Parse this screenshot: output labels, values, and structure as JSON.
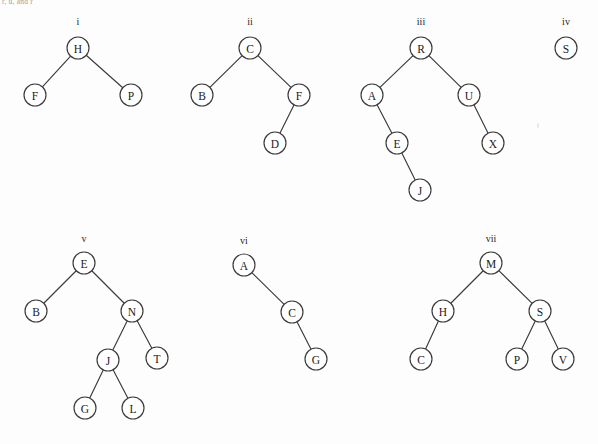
{
  "page": {
    "caption_fragment": "r, u, and r",
    "background_color": "#fdfdfd",
    "node_stroke_color": "#3a3a3a",
    "node_fill_color": "#ffffff",
    "text_color": "#1b1b1b",
    "width": 598,
    "height": 444
  },
  "chart_data": {
    "type": "diagram",
    "diagram_kind": "binary-tree-collection",
    "title": "",
    "trees": [
      {
        "label": "i",
        "label_x": 78,
        "label_y": 21,
        "nodes": [
          {
            "id": "n1",
            "value": "H",
            "x": 78,
            "y": 48,
            "r": 11
          },
          {
            "id": "n2",
            "value": "F",
            "x": 35,
            "y": 95,
            "r": 11
          },
          {
            "id": "n3",
            "value": "P",
            "x": 131,
            "y": 95,
            "r": 11
          }
        ],
        "edges": [
          {
            "from": "n1",
            "to": "n2"
          },
          {
            "from": "n1",
            "to": "n3"
          }
        ]
      },
      {
        "label": "ii",
        "label_x": 250,
        "label_y": 21,
        "nodes": [
          {
            "id": "n1",
            "value": "C",
            "x": 250,
            "y": 48,
            "r": 11
          },
          {
            "id": "n2",
            "value": "B",
            "x": 202,
            "y": 95,
            "r": 11
          },
          {
            "id": "n3",
            "value": "F",
            "x": 299,
            "y": 95,
            "r": 11
          },
          {
            "id": "n4",
            "value": "D",
            "x": 275,
            "y": 143,
            "r": 11
          }
        ],
        "edges": [
          {
            "from": "n1",
            "to": "n2"
          },
          {
            "from": "n1",
            "to": "n3"
          },
          {
            "from": "n3",
            "to": "n4"
          }
        ]
      },
      {
        "label": "iii",
        "label_x": 421,
        "label_y": 21,
        "nodes": [
          {
            "id": "n1",
            "value": "R",
            "x": 421,
            "y": 48,
            "r": 11
          },
          {
            "id": "n2",
            "value": "A",
            "x": 372,
            "y": 95,
            "r": 11
          },
          {
            "id": "n3",
            "value": "U",
            "x": 469,
            "y": 95,
            "r": 11
          },
          {
            "id": "n4",
            "value": "E",
            "x": 397,
            "y": 143,
            "r": 11
          },
          {
            "id": "n5",
            "value": "X",
            "x": 493,
            "y": 143,
            "r": 11
          },
          {
            "id": "n6",
            "value": "J",
            "x": 420,
            "y": 190,
            "r": 11
          }
        ],
        "edges": [
          {
            "from": "n1",
            "to": "n2"
          },
          {
            "from": "n1",
            "to": "n3"
          },
          {
            "from": "n2",
            "to": "n4"
          },
          {
            "from": "n3",
            "to": "n5"
          },
          {
            "from": "n4",
            "to": "n6"
          }
        ]
      },
      {
        "label": "iv",
        "label_x": 566,
        "label_y": 21,
        "nodes": [
          {
            "id": "n1",
            "value": "S",
            "x": 566,
            "y": 48,
            "r": 11
          }
        ],
        "edges": []
      },
      {
        "label": "v",
        "label_x": 84,
        "label_y": 238,
        "nodes": [
          {
            "id": "n1",
            "value": "E",
            "x": 84,
            "y": 263,
            "r": 11
          },
          {
            "id": "n2",
            "value": "B",
            "x": 36,
            "y": 311,
            "r": 11
          },
          {
            "id": "n3",
            "value": "N",
            "x": 132,
            "y": 311,
            "r": 11
          },
          {
            "id": "n4",
            "value": "J",
            "x": 108,
            "y": 360,
            "r": 11
          },
          {
            "id": "n5",
            "value": "T",
            "x": 157,
            "y": 358,
            "r": 11
          },
          {
            "id": "n6",
            "value": "G",
            "x": 85,
            "y": 408,
            "r": 11
          },
          {
            "id": "n7",
            "value": "L",
            "x": 133,
            "y": 408,
            "r": 11
          }
        ],
        "edges": [
          {
            "from": "n1",
            "to": "n2"
          },
          {
            "from": "n1",
            "to": "n3"
          },
          {
            "from": "n3",
            "to": "n4"
          },
          {
            "from": "n3",
            "to": "n5"
          },
          {
            "from": "n4",
            "to": "n6"
          },
          {
            "from": "n4",
            "to": "n7"
          }
        ]
      },
      {
        "label": "vi",
        "label_x": 244,
        "label_y": 240,
        "nodes": [
          {
            "id": "n1",
            "value": "A",
            "x": 244,
            "y": 265,
            "r": 11
          },
          {
            "id": "n2",
            "value": "C",
            "x": 292,
            "y": 312,
            "r": 11
          },
          {
            "id": "n3",
            "value": "G",
            "x": 316,
            "y": 359,
            "r": 11
          }
        ],
        "edges": [
          {
            "from": "n1",
            "to": "n2"
          },
          {
            "from": "n2",
            "to": "n3"
          }
        ]
      },
      {
        "label": "vii",
        "label_x": 491,
        "label_y": 238,
        "nodes": [
          {
            "id": "n1",
            "value": "M",
            "x": 491,
            "y": 263,
            "r": 11
          },
          {
            "id": "n2",
            "value": "H",
            "x": 443,
            "y": 311,
            "r": 11
          },
          {
            "id": "n3",
            "value": "S",
            "x": 540,
            "y": 311,
            "r": 11
          },
          {
            "id": "n4",
            "value": "C",
            "x": 421,
            "y": 359,
            "r": 11
          },
          {
            "id": "n5",
            "value": "P",
            "x": 517,
            "y": 359,
            "r": 11
          },
          {
            "id": "n6",
            "value": "V",
            "x": 563,
            "y": 359,
            "r": 11
          }
        ],
        "edges": [
          {
            "from": "n1",
            "to": "n2"
          },
          {
            "from": "n1",
            "to": "n3"
          },
          {
            "from": "n2",
            "to": "n4"
          },
          {
            "from": "n3",
            "to": "n5"
          },
          {
            "from": "n3",
            "to": "n6"
          }
        ]
      }
    ]
  }
}
